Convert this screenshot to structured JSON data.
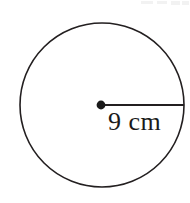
{
  "figure": {
    "background_color": "#ffffff",
    "stroke_color": "#231f20",
    "text_color": "#1a1a1a",
    "radius_label": "9 cm",
    "units": "cm",
    "radius_value": 9
  },
  "geometry": {
    "circle": {
      "center_x": 102,
      "center_y": 105,
      "radius_px": 82,
      "stroke_width": 1.6
    },
    "center_dot": {
      "center_x": 101,
      "center_y": 105,
      "radius_px": 4.4
    },
    "radius_line": {
      "x1": 101,
      "y1": 105,
      "x2": 184,
      "y2": 105,
      "stroke_width": 1.8
    }
  },
  "artifacts": {
    "top_right_marks": 4
  }
}
